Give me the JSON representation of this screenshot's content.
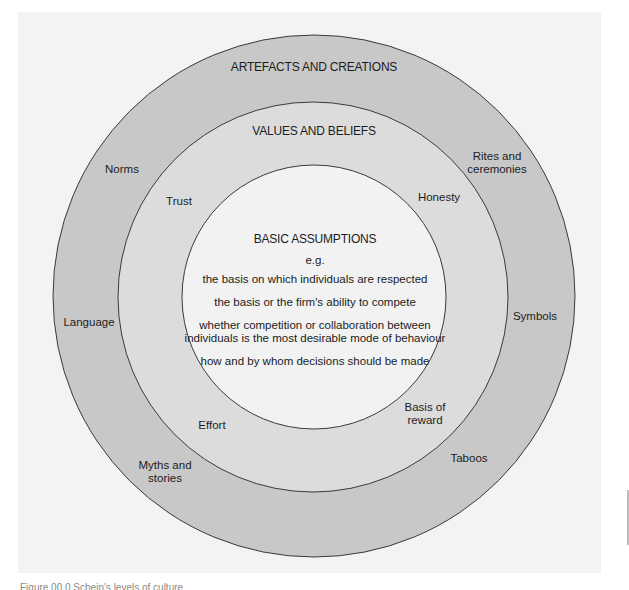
{
  "diagram": {
    "type": "concentric-circles",
    "colors": {
      "page_background": "#ffffff",
      "panel_background": "#f3f3f3",
      "outer_ring": "#c8c8c8",
      "middle_ring": "#dcdcdc",
      "inner_circle": "#f2f2f2",
      "stroke": "#3a3a3a"
    },
    "outer_ring": {
      "title": "ARTEFACTS AND CREATIONS",
      "items": [
        {
          "id": "norms",
          "label": "Norms"
        },
        {
          "id": "rites",
          "label": "Rites and\nceremonies",
          "lines": [
            "Rites and",
            "ceremonies"
          ]
        },
        {
          "id": "language",
          "label": "Language"
        },
        {
          "id": "symbols",
          "label": "Symbols"
        },
        {
          "id": "myths",
          "label": "Myths and\nstories",
          "lines": [
            "Myths and",
            "stories"
          ]
        },
        {
          "id": "taboos",
          "label": "Taboos"
        }
      ]
    },
    "middle_ring": {
      "title": "VALUES AND BELIEFS",
      "items": [
        {
          "id": "trust",
          "label": "Trust"
        },
        {
          "id": "honesty",
          "label": "Honesty"
        },
        {
          "id": "effort",
          "label": "Effort"
        },
        {
          "id": "reward",
          "label": "Basis of\nreward",
          "lines": [
            "Basis of",
            "reward"
          ]
        }
      ]
    },
    "inner_circle": {
      "title": "BASIC ASSUMPTIONS",
      "subtitle": "e.g.",
      "items": [
        "the basis on which individuals are respected",
        "the basis or the firm's ability to compete",
        "whether competition or collaboration between",
        "individuals is the most desirable mode of behaviour",
        "how and by whom decisions should be made"
      ]
    }
  },
  "caption": "Figure 00.0 Schein's levels of culture"
}
